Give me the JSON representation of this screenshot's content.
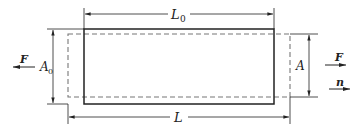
{
  "diagram": {
    "labels": {
      "original_length": "L",
      "original_length_sub": "0",
      "final_length": "L",
      "original_area": "A",
      "original_area_sub": "0",
      "final_area": "A",
      "force_left": "F",
      "force_right": "F",
      "normal": "n"
    },
    "shapes": {
      "original": {
        "style": "solid",
        "x": 84,
        "y": 29,
        "width": 190,
        "height": 75
      },
      "deformed": {
        "style": "dashed",
        "x": 68,
        "y": 34,
        "width": 222,
        "height": 63
      }
    },
    "colors": {
      "stroke": "#222222",
      "dashed": "#777777"
    }
  }
}
